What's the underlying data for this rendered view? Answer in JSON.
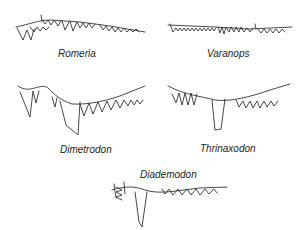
{
  "figure": {
    "panels": [
      {
        "id": "romeria",
        "label": "Romeria"
      },
      {
        "id": "varanops",
        "label": "Varanops"
      },
      {
        "id": "dimetrodon",
        "label": "Dimetrodon"
      },
      {
        "id": "thrinaxodon",
        "label": "Thrinaxodon"
      },
      {
        "id": "diademodon",
        "label": "Diademodon"
      }
    ]
  }
}
